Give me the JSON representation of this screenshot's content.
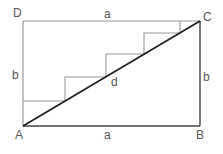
{
  "diagram": {
    "vertices": {
      "A": {
        "label": "A",
        "x": 23,
        "y": 126
      },
      "B": {
        "label": "B",
        "x": 200,
        "y": 126
      },
      "C": {
        "label": "C",
        "x": 200,
        "y": 21
      },
      "D": {
        "label": "D",
        "x": 23,
        "y": 21
      }
    },
    "side_labels": {
      "top": "a",
      "bottom": "a",
      "left": "b",
      "right": "b"
    },
    "diagonal_label": "d",
    "staircase_steps": 4,
    "colors": {
      "rectangle_left_top": "#9a9a9a",
      "rectangle_right_bottom": "#444444",
      "diagonal": "#222222",
      "stairs": "#9a9a9a",
      "labels": "#555555"
    }
  }
}
